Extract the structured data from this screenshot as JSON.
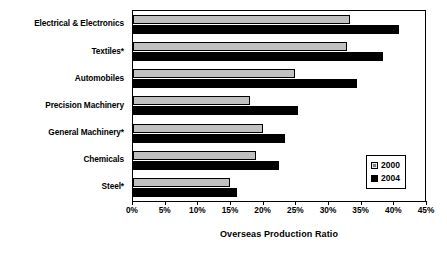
{
  "chart_data": {
    "type": "bar",
    "orientation": "horizontal",
    "title": "",
    "xlabel": "Overseas Production Ratio",
    "ylabel": "",
    "categories": [
      "Electrical & Electronics",
      "Textiles*",
      "Automobiles",
      "Precision Machinery",
      "General Machinery*",
      "Chemicals",
      "Steel*"
    ],
    "series": [
      {
        "name": "2000",
        "color": "#c0c0c0",
        "values": [
          33.5,
          33,
          25,
          18,
          20,
          19,
          15
        ]
      },
      {
        "name": "2004",
        "color": "#000000",
        "values": [
          41,
          38.5,
          34.5,
          25.5,
          23.5,
          22.5,
          16
        ]
      }
    ],
    "xlim": [
      0,
      45
    ],
    "xticks": [
      0,
      5,
      10,
      15,
      20,
      25,
      30,
      35,
      40,
      45
    ],
    "xticklabels": [
      "0%",
      "5%",
      "10%",
      "15%",
      "20%",
      "25%",
      "30%",
      "35%",
      "40%",
      "45%"
    ],
    "grid": false,
    "legend_position": "bottom-right",
    "value_unit": "%"
  },
  "legend": {
    "entries": [
      {
        "label": "2000",
        "swatch": "light-gray"
      },
      {
        "label": "2004",
        "swatch": "black"
      }
    ]
  }
}
